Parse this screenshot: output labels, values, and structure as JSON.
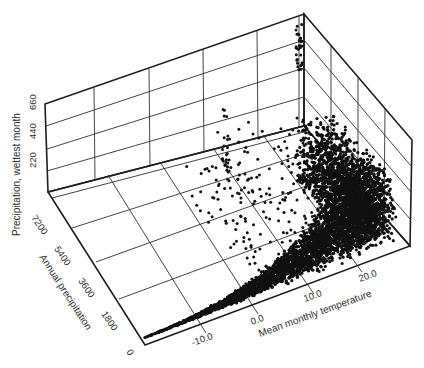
{
  "chart_data": {
    "type": "scatter",
    "subtype": "3d-scatter",
    "title": "",
    "axes": {
      "x": {
        "label": "Mean monthly temperature",
        "ticks": [
          "-10.0",
          "0.0",
          "10.0",
          "20.0"
        ],
        "range": [
          -17,
          27
        ]
      },
      "y": {
        "label": "Annual precipitation",
        "ticks": [
          "0",
          "1800",
          "3600",
          "5400",
          "7200"
        ],
        "range": [
          0,
          7200
        ]
      },
      "z": {
        "label": "Precipitation, wettest month",
        "ticks": [
          "220",
          "440",
          "660"
        ],
        "range": [
          0,
          880
        ]
      }
    },
    "grid": true,
    "legend": null,
    "series": [
      {
        "name": "sites",
        "sample_points": [
          {
            "temp": -14,
            "annual": 200,
            "wettest": 30
          },
          {
            "temp": -10,
            "annual": 400,
            "wettest": 60
          },
          {
            "temp": -5,
            "annual": 600,
            "wettest": 90
          },
          {
            "temp": 0,
            "annual": 900,
            "wettest": 130
          },
          {
            "temp": 5,
            "annual": 1300,
            "wettest": 180
          },
          {
            "temp": 10,
            "annual": 1800,
            "wettest": 240
          },
          {
            "temp": 15,
            "annual": 2400,
            "wettest": 320
          },
          {
            "temp": 20,
            "annual": 3000,
            "wettest": 400
          },
          {
            "temp": 25,
            "annual": 3600,
            "wettest": 480
          },
          {
            "temp": 26,
            "annual": 6800,
            "wettest": 860
          }
        ]
      }
    ]
  },
  "labels": {
    "z_axis": "Precipitation, wettest month",
    "y_axis": "Annual precipitation",
    "x_axis": "Mean monthly temperature",
    "z_ticks": [
      "220",
      "440",
      "660"
    ],
    "y_ticks": [
      "7200",
      "5400",
      "3600",
      "1800",
      "0"
    ],
    "x_ticks": [
      "-10.0",
      "0.0",
      "10.0",
      "20.0"
    ]
  }
}
